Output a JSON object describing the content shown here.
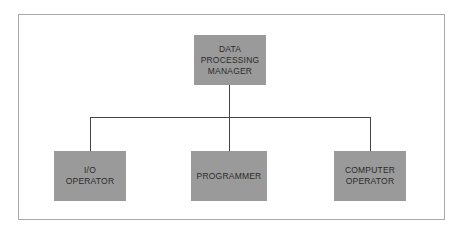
{
  "diagram": {
    "type": "org-chart",
    "colors": {
      "box_fill": "#9a9a9a",
      "text": "#2a2a2a",
      "connector": "#444444",
      "frame_border": "#a9a9a9",
      "background": "#ffffff"
    },
    "root": {
      "label_lines": [
        "DATA",
        "PROCESSING",
        "MANAGER"
      ]
    },
    "children": [
      {
        "label_lines": [
          "I/O",
          "OPERATOR"
        ]
      },
      {
        "label_lines": [
          "PROGRAMMER"
        ]
      },
      {
        "label_lines": [
          "COMPUTER",
          "OPERATOR"
        ]
      }
    ]
  }
}
